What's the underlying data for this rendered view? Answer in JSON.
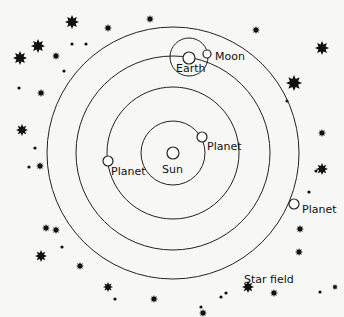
{
  "diagram": {
    "colors": {
      "line": "#222222",
      "background": "#f7f7f5",
      "star": "#111111"
    },
    "sun": {
      "label": "Sun",
      "cx": 173,
      "cy": 153,
      "r": 6,
      "label_x": 162,
      "label_y": 173
    },
    "orbits": [
      {
        "name": "inner-orbit",
        "r": 32
      },
      {
        "name": "second-orbit",
        "r": 66
      },
      {
        "name": "earth-orbit",
        "r": 97
      },
      {
        "name": "outer-orbit",
        "r": 126
      }
    ],
    "planets": [
      {
        "label": "Planet",
        "cx": 202,
        "cy": 137,
        "r": 5,
        "label_x": 207,
        "label_y": 150
      },
      {
        "label": "Planet",
        "cx": 108,
        "cy": 161,
        "r": 5,
        "label_x": 111,
        "label_y": 175
      },
      {
        "label": "Planet",
        "cx": 294,
        "cy": 204,
        "r": 5,
        "label_x": 302,
        "label_y": 213
      }
    ],
    "earth": {
      "label": "Earth",
      "cx": 189,
      "cy": 58,
      "r": 6,
      "label_x": 176,
      "label_y": 72
    },
    "moon_orbit": {
      "cx": 189,
      "cy": 57,
      "r": 19
    },
    "moon": {
      "label": "Moon",
      "cx": 207,
      "cy": 54,
      "r": 4,
      "label_x": 215,
      "label_y": 60
    },
    "star_field": {
      "label": "Star field",
      "label_x": 244,
      "label_y": 283
    },
    "stars_big": [
      [
        72,
        22,
        7
      ],
      [
        38,
        46,
        7
      ],
      [
        20,
        58,
        7
      ],
      [
        322,
        48,
        7
      ],
      [
        294,
        83,
        8
      ],
      [
        22,
        130,
        6
      ],
      [
        41,
        256,
        6
      ],
      [
        248,
        287,
        6
      ],
      [
        108,
        287,
        5
      ],
      [
        322,
        169,
        6
      ],
      [
        40,
        166,
        4
      ],
      [
        154,
        299,
        4
      ]
    ],
    "stars_med": [
      [
        56,
        56,
        4
      ],
      [
        41,
        93,
        4
      ],
      [
        150,
        19,
        4
      ],
      [
        108,
        28,
        4
      ],
      [
        256,
        30,
        4
      ],
      [
        322,
        133,
        4
      ],
      [
        300,
        229,
        4
      ],
      [
        299,
        252,
        4
      ],
      [
        274,
        293,
        4
      ],
      [
        56,
        230,
        4
      ],
      [
        46,
        228,
        4
      ],
      [
        80,
        266,
        4
      ],
      [
        203,
        313,
        4
      ],
      [
        335,
        287,
        3
      ]
    ],
    "dots": [
      [
        72,
        44
      ],
      [
        86,
        44
      ],
      [
        64,
        71
      ],
      [
        19,
        88
      ],
      [
        35,
        148
      ],
      [
        29,
        167
      ],
      [
        62,
        247
      ],
      [
        115,
        299
      ],
      [
        221,
        297
      ],
      [
        309,
        192
      ],
      [
        287,
        101
      ],
      [
        201,
        307
      ],
      [
        226,
        293
      ],
      [
        320,
        292
      ],
      [
        316,
        171
      ]
    ]
  }
}
